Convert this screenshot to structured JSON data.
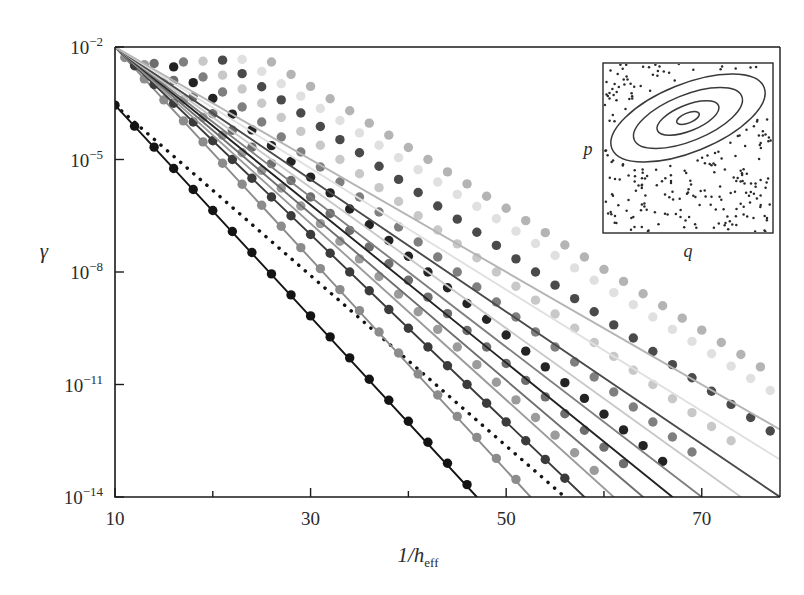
{
  "chart_data": {
    "type": "line",
    "title": "",
    "xlabel": "1/h_eff",
    "xlabel_parts": {
      "lead": "1/",
      "italic": "h",
      "sub": "eff"
    },
    "ylabel": "γ",
    "xlim": [
      10,
      78
    ],
    "ylim_log10": [
      -14,
      -2
    ],
    "y_scale": "log",
    "grid": false,
    "legend": "none",
    "x_ticks_major": [
      10,
      30,
      50,
      70
    ],
    "x_ticks_minor": [
      20,
      40,
      60
    ],
    "x_tick_labels": [
      "10",
      "30",
      "50",
      "70"
    ],
    "y_ticks_log10": [
      -2,
      -5,
      -8,
      -11,
      -14
    ],
    "y_tick_labels": [
      "10−2",
      "10−5",
      "10−8",
      "10−11",
      "10−14"
    ],
    "y_tick_mantissa": "10",
    "y_tick_exponents": [
      "-2",
      "-5",
      "-8",
      "-11",
      "-14"
    ],
    "marker": "filled-circle",
    "marker_size_px": 9,
    "series": [
      {
        "name": "s1",
        "color": "#141414",
        "line": "solid",
        "x_start": 10,
        "x_end": 47,
        "y_start_log10": -3.55,
        "y_end_log10": -14.0,
        "points_x": [
          10,
          12,
          14,
          16,
          18,
          20,
          22,
          24,
          26,
          28,
          30,
          32,
          34,
          36,
          38,
          40,
          42,
          44,
          46
        ],
        "points_y_log10": [
          -3.55,
          -4.11,
          -4.67,
          -5.24,
          -5.8,
          -6.36,
          -6.92,
          -7.48,
          -8.05,
          -8.61,
          -9.17,
          -9.73,
          -10.29,
          -10.86,
          -11.42,
          -11.98,
          -12.54,
          -13.1,
          -13.67
        ]
      },
      {
        "name": "s2-dotted-reference",
        "color": "#141414",
        "line": "dotted",
        "x_start": 10,
        "x_end": 56,
        "y_start_log10": -3.55,
        "y_end_log10": -14.0,
        "points_x": [],
        "points_y_log10": []
      },
      {
        "name": "s3",
        "color": "#8c8c8c",
        "line": "solid",
        "x_start": 10,
        "x_end": 52.5,
        "y_start_log10": -2.0,
        "y_end_log10": -14.0,
        "points_x": [
          11,
          13,
          15,
          17,
          19,
          21,
          23,
          25,
          27,
          29,
          31,
          33,
          35,
          37,
          39,
          41,
          43,
          45,
          47,
          49,
          51
        ],
        "points_y_log10": [
          -2.28,
          -2.85,
          -3.41,
          -3.97,
          -4.53,
          -5.1,
          -5.66,
          -6.22,
          -6.78,
          -7.35,
          -7.91,
          -8.47,
          -9.03,
          -9.6,
          -10.16,
          -10.72,
          -11.28,
          -11.85,
          -12.41,
          -12.97,
          -13.53
        ]
      },
      {
        "name": "s4",
        "color": "#3b3b3b",
        "line": "solid",
        "x_start": 10,
        "x_end": 58,
        "y_start_log10": -2.0,
        "y_end_log10": -14.0,
        "points_x": [
          12,
          14,
          16,
          18,
          20,
          22,
          24,
          26,
          28,
          30,
          32,
          34,
          36,
          38,
          40,
          42,
          44,
          46,
          48,
          50,
          52,
          54,
          56
        ],
        "points_y_log10": [
          -2.5,
          -3.0,
          -3.5,
          -4.0,
          -4.5,
          -5.0,
          -5.5,
          -6.0,
          -6.5,
          -7.0,
          -7.5,
          -8.0,
          -8.5,
          -9.0,
          -9.5,
          -10.0,
          -10.5,
          -11.0,
          -11.5,
          -12.0,
          -12.5,
          -13.0,
          -13.5
        ]
      },
      {
        "name": "s5",
        "color": "#9b9b9b",
        "line": "solid",
        "x_start": 10,
        "x_end": 61,
        "y_start_log10": -2.0,
        "y_end_log10": -14.0,
        "points_x": [
          13,
          15,
          17,
          19,
          21,
          23,
          25,
          27,
          29,
          31,
          33,
          35,
          37,
          39,
          41,
          43,
          45,
          47,
          49,
          51,
          53,
          55,
          57,
          59
        ],
        "points_y_log10": [
          -2.47,
          -2.94,
          -3.41,
          -3.88,
          -4.35,
          -4.82,
          -5.29,
          -5.76,
          -6.24,
          -6.71,
          -7.18,
          -7.65,
          -8.12,
          -8.59,
          -9.06,
          -9.53,
          -10.0,
          -10.47,
          -10.94,
          -11.41,
          -11.88,
          -12.35,
          -12.82,
          -13.29
        ]
      },
      {
        "name": "s6",
        "color": "#6e6e6e",
        "line": "solid",
        "x_start": 10,
        "x_end": 64,
        "y_start_log10": -2.0,
        "y_end_log10": -14.0,
        "points_x": [
          14,
          16,
          18,
          20,
          22,
          24,
          26,
          28,
          30,
          32,
          34,
          36,
          38,
          40,
          42,
          44,
          46,
          48,
          50,
          52,
          54,
          56,
          58,
          60,
          62
        ],
        "points_y_log10": [
          -2.44,
          -2.89,
          -3.33,
          -3.78,
          -4.22,
          -4.67,
          -5.11,
          -5.56,
          -6.0,
          -6.44,
          -6.89,
          -7.33,
          -7.78,
          -8.22,
          -8.67,
          -9.11,
          -9.56,
          -10.0,
          -10.44,
          -10.89,
          -11.33,
          -11.78,
          -12.22,
          -12.67,
          -13.11
        ]
      },
      {
        "name": "s7",
        "color": "#232323",
        "line": "solid",
        "x_start": 10,
        "x_end": 67,
        "y_start_log10": -2.0,
        "y_end_log10": -14.0,
        "points_x": [
          16,
          18,
          20,
          22,
          24,
          26,
          28,
          30,
          32,
          34,
          36,
          38,
          40,
          42,
          44,
          46,
          48,
          50,
          52,
          54,
          56,
          58,
          60,
          62,
          64,
          66
        ],
        "points_y_log10": [
          -2.53,
          -2.95,
          -3.37,
          -3.79,
          -4.21,
          -4.63,
          -5.05,
          -5.47,
          -5.89,
          -6.32,
          -6.74,
          -7.16,
          -7.58,
          -8.0,
          -8.42,
          -8.84,
          -9.26,
          -9.68,
          -10.11,
          -10.53,
          -10.95,
          -11.37,
          -11.79,
          -12.21,
          -12.63,
          -13.05
        ]
      },
      {
        "name": "s8",
        "color": "#7f7f7f",
        "line": "solid",
        "x_start": 10,
        "x_end": 70,
        "y_start_log10": -2.0,
        "y_end_log10": -14.0,
        "points_x": [
          17,
          19,
          21,
          23,
          25,
          27,
          29,
          31,
          33,
          35,
          37,
          39,
          41,
          43,
          45,
          47,
          49,
          51,
          53,
          55,
          57,
          59,
          61,
          63,
          65,
          67,
          69
        ],
        "points_y_log10": [
          -2.4,
          -2.8,
          -3.2,
          -3.6,
          -4.0,
          -4.4,
          -4.8,
          -5.2,
          -5.6,
          -6.0,
          -6.4,
          -6.8,
          -7.2,
          -7.6,
          -8.0,
          -8.4,
          -8.8,
          -9.2,
          -9.6,
          -10.0,
          -10.4,
          -10.8,
          -11.2,
          -11.6,
          -12.0,
          -12.4,
          -12.8
        ]
      },
      {
        "name": "s9",
        "color": "#c8c8c8",
        "line": "solid",
        "x_start": 10,
        "x_end": 74,
        "y_start_log10": -2.0,
        "y_end_log10": -14.0,
        "points_x": [
          19,
          21,
          23,
          25,
          27,
          29,
          31,
          33,
          35,
          37,
          39,
          41,
          43,
          45,
          47,
          49,
          51,
          53,
          55,
          57,
          59,
          61,
          63,
          65,
          67,
          69,
          71,
          73
        ],
        "points_y_log10": [
          -2.38,
          -2.75,
          -3.12,
          -3.5,
          -3.88,
          -4.25,
          -4.62,
          -5.0,
          -5.38,
          -5.75,
          -6.12,
          -6.5,
          -6.88,
          -7.25,
          -7.62,
          -8.0,
          -8.38,
          -8.75,
          -9.12,
          -9.5,
          -9.88,
          -10.25,
          -10.62,
          -11.0,
          -11.38,
          -11.75,
          -12.12,
          -12.5
        ]
      },
      {
        "name": "s10",
        "color": "#4a4a4a",
        "line": "solid",
        "x_start": 10,
        "x_end": 78,
        "y_start_log10": -2.0,
        "y_end_log10": -14.0,
        "points_x": [
          21,
          23,
          25,
          27,
          29,
          31,
          33,
          35,
          37,
          39,
          41,
          43,
          45,
          47,
          49,
          51,
          53,
          55,
          57,
          59,
          61,
          63,
          65,
          67,
          69,
          71,
          73,
          75,
          77
        ],
        "points_y_log10": [
          -2.35,
          -2.71,
          -3.06,
          -3.41,
          -3.76,
          -4.12,
          -4.47,
          -4.82,
          -5.18,
          -5.53,
          -5.88,
          -6.24,
          -6.59,
          -6.94,
          -7.29,
          -7.65,
          -8.0,
          -8.35,
          -8.71,
          -9.06,
          -9.41,
          -9.76,
          -10.12,
          -10.47,
          -10.82,
          -11.18,
          -11.53,
          -11.88,
          -12.24
        ]
      },
      {
        "name": "s11",
        "color": "#e0e0e0",
        "line": "solid",
        "x_start": 10,
        "x_end": 78,
        "y_start_log10": -2.0,
        "y_end_log10": -13.0,
        "points_x": [
          23,
          25,
          27,
          29,
          31,
          33,
          35,
          37,
          39,
          41,
          43,
          45,
          47,
          49,
          51,
          53,
          55,
          57,
          59,
          61,
          63,
          65,
          67,
          69,
          71,
          73,
          75,
          77
        ],
        "points_y_log10": [
          -2.33,
          -2.65,
          -2.98,
          -3.31,
          -3.64,
          -3.96,
          -4.29,
          -4.62,
          -4.95,
          -5.27,
          -5.6,
          -5.93,
          -6.25,
          -6.58,
          -6.91,
          -7.24,
          -7.56,
          -7.89,
          -8.22,
          -8.55,
          -8.87,
          -9.2,
          -9.53,
          -9.85,
          -10.18,
          -10.51,
          -10.84,
          -11.16
        ]
      },
      {
        "name": "s12",
        "color": "#b4b4b4",
        "line": "solid",
        "x_start": 10,
        "x_end": 78,
        "y_start_log10": -2.0,
        "y_end_log10": -12.2,
        "points_x": [
          26,
          28,
          30,
          32,
          34,
          36,
          38,
          40,
          42,
          44,
          46,
          48,
          50,
          52,
          54,
          56,
          58,
          60,
          62,
          64,
          66,
          68,
          70,
          72,
          74,
          76
        ],
        "points_y_log10": [
          -2.4,
          -2.73,
          -3.05,
          -3.38,
          -3.7,
          -4.03,
          -4.35,
          -4.68,
          -5.0,
          -5.33,
          -5.65,
          -5.98,
          -6.3,
          -6.63,
          -6.95,
          -7.28,
          -7.6,
          -7.93,
          -8.25,
          -8.58,
          -8.9,
          -9.23,
          -9.55,
          -9.88,
          -10.2,
          -10.53
        ]
      }
    ]
  },
  "inset": {
    "name": "phase-space-inset",
    "xlabel": "q",
    "ylabel": "p",
    "description": "regular island with nested invariant tori embedded in chaotic sea",
    "ellipse_count": 4,
    "ellipse_rotation_deg": -22,
    "chaotic_dot_count": 230
  },
  "colors": {
    "frame": "#1a1a1a",
    "text": "#2b2b2b",
    "background": "#ffffff"
  }
}
